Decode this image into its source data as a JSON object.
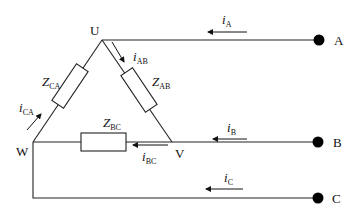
{
  "diagram": {
    "type": "three-phase delta load circuit",
    "nodes": {
      "U": "U",
      "V": "V",
      "W": "W"
    },
    "terminals": {
      "A": "A",
      "B": "B",
      "C": "C"
    },
    "impedances": {
      "AB": {
        "main": "Z",
        "sub": "AB"
      },
      "BC": {
        "main": "Z",
        "sub": "BC"
      },
      "CA": {
        "main": "Z",
        "sub": "CA"
      }
    },
    "currents": {
      "iA": {
        "main": "i",
        "sub": "A"
      },
      "iB": {
        "main": "i",
        "sub": "B"
      },
      "iC": {
        "main": "i",
        "sub": "C"
      },
      "iAB": {
        "main": "i",
        "sub": "AB"
      },
      "iBC": {
        "main": "i",
        "sub": "BC"
      },
      "iCA": {
        "main": "i",
        "sub": "CA"
      }
    }
  }
}
